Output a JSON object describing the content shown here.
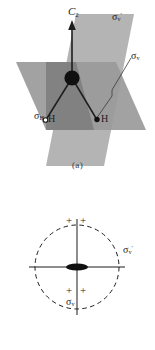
{
  "figure": {
    "background_color": "#ffffff",
    "stroke_color": "#1d1d1d",
    "plane_color_horizontal": "#9a9a9a",
    "plane_color_vertical": "#b4b4b4",
    "plane_color_overlap": "#787878"
  },
  "panel_a": {
    "caption": "(a)",
    "labels": {
      "rotation_axis": {
        "symbol": "C",
        "subscript": "2",
        "name": "c2-axis-label"
      },
      "sigma_v_prime": {
        "symbol": "σ",
        "subscript": "v",
        "prime": "′",
        "name": "sigma-v-prime-label"
      },
      "sigma_v": {
        "symbol": "σ",
        "subscript": "v",
        "name": "sigma-v-label"
      },
      "sigma_h": {
        "symbol": "σ",
        "subscript": "H",
        "name": "sigma-h-label"
      },
      "atom_left": "H",
      "atom_right": "H"
    },
    "atoms": [
      {
        "element": "O",
        "style": "large-filled-circle",
        "x": 72,
        "y": 78
      },
      {
        "element": "H",
        "style": "small-open-circle",
        "x": 46,
        "y": 120
      },
      {
        "element": "H",
        "style": "small-filled-circle",
        "x": 97,
        "y": 120
      }
    ]
  },
  "panel_b": {
    "caption": "(b)",
    "labels": {
      "sigma_v_prime": {
        "symbol": "σ",
        "subscript": "v",
        "prime": "′",
        "name": "sigma-v-prime-label"
      },
      "sigma_v": {
        "symbol": "σ",
        "subscript": "v",
        "name": "sigma-v-label"
      }
    },
    "orbital_signs": [
      {
        "sign": "+",
        "quadrant": "top-left"
      },
      {
        "sign": "+",
        "quadrant": "top-right"
      },
      {
        "sign": "+",
        "quadrant": "bottom-left"
      },
      {
        "sign": "+",
        "quadrant": "bottom-right"
      }
    ],
    "circle": {
      "style": "dashed",
      "cx": 77,
      "cy": 92,
      "r": 42
    },
    "center_lobe": {
      "style": "filled-lens",
      "cx": 77,
      "cy": 92
    }
  }
}
